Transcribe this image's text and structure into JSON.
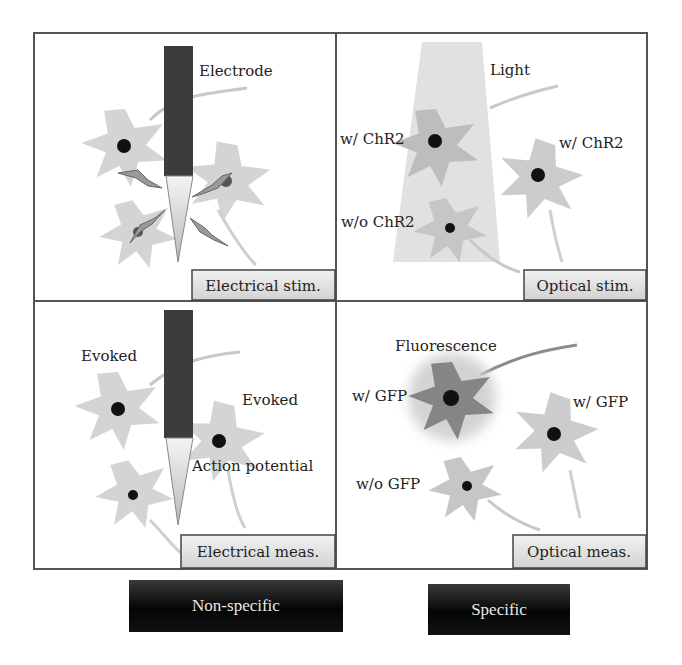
{
  "panels": {
    "electrical_stim": {
      "tag": "Electrical stim.",
      "labels": {
        "electrode": "Electrode"
      }
    },
    "optical_stim": {
      "tag": "Optical stim.",
      "labels": {
        "light": "Light",
        "with_left": "w/ ChR2",
        "with_right": "w/ ChR2",
        "without": "w/o ChR2"
      }
    },
    "electrical_meas": {
      "tag": "Electrical meas.",
      "labels": {
        "evoked_left": "Evoked",
        "evoked_right": "Evoked",
        "action_potential": "Action potential"
      }
    },
    "optical_meas": {
      "tag": "Optical meas.",
      "labels": {
        "fluorescence": "Fluorescence",
        "with_left": "w/ GFP",
        "with_right": "w/ GFP",
        "without": "w/o GFP"
      }
    }
  },
  "categories": {
    "left": "Non-specific",
    "right": "Specific"
  },
  "colors": {
    "neuron": "#d4d4d4",
    "neuron_dark": "#8c8c8c",
    "electrode": "#3c3c3c",
    "light": "#dcdcdc",
    "border": "#555555",
    "tag_bg": "#e6e6e6"
  }
}
